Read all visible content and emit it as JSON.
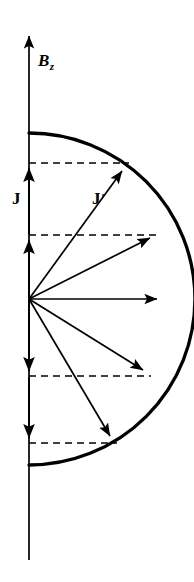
{
  "figure": {
    "background_color": "#ffffff",
    "ink_color": "#000000",
    "labels": {
      "field_axis": "B",
      "field_axis_subscript": "z",
      "current_axial": "J",
      "current_radial": "J",
      "current_radial_prime": "′"
    },
    "axis": {
      "name": "vertical-field-axis",
      "x": 29,
      "top_y": 32,
      "bottom_y": 560,
      "arrow_direction": "up",
      "stroke_width": 1.6
    },
    "semicircle": {
      "name": "current-profile-semicircle",
      "center_x": 29,
      "center_y": 299,
      "radius": 166,
      "top_y": 133,
      "bottom_y": 465,
      "right_x": 195,
      "stroke_width": 3.2
    },
    "dashed_lines": [
      {
        "label": "dashed-level-1",
        "y": 163,
        "x_start": 29,
        "x_end": 129
      },
      {
        "label": "dashed-level-2",
        "y": 235,
        "x_start": 29,
        "x_end": 158
      },
      {
        "label": "dashed-level-3",
        "y": 376,
        "x_start": 29,
        "x_end": 151
      },
      {
        "label": "dashed-level-4",
        "y": 443,
        "x_start": 29,
        "x_end": 117
      }
    ],
    "axial_arrows": [
      {
        "label": "axial-arrow-up-outer",
        "x": 29,
        "from_y": 235,
        "to_y": 165,
        "direction": "up"
      },
      {
        "label": "axial-arrow-up-inner",
        "x": 29,
        "from_y": 299,
        "to_y": 237,
        "direction": "up"
      },
      {
        "label": "axial-arrow-down-inner",
        "x": 29,
        "from_y": 299,
        "to_y": 374,
        "direction": "down"
      },
      {
        "label": "axial-arrow-down-outer",
        "x": 29,
        "from_y": 376,
        "to_y": 441,
        "direction": "down"
      }
    ],
    "radial_arrows": [
      {
        "label": "radial-arrow-1",
        "from_x": 29,
        "from_y": 299,
        "to_x": 126,
        "to_y": 166
      },
      {
        "label": "radial-arrow-2",
        "from_x": 29,
        "from_y": 299,
        "to_x": 155,
        "to_y": 237
      },
      {
        "label": "radial-arrow-3",
        "from_x": 29,
        "from_y": 299,
        "to_x": 162,
        "to_y": 299
      },
      {
        "label": "radial-arrow-4",
        "from_x": 29,
        "from_y": 299,
        "to_x": 148,
        "to_y": 374
      },
      {
        "label": "radial-arrow-5",
        "from_x": 29,
        "from_y": 299,
        "to_x": 114,
        "to_y": 441
      }
    ]
  }
}
